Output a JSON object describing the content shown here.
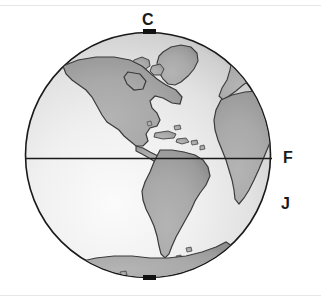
{
  "figure": {
    "name": "earth-globe-diagram"
  },
  "labels": [
    {
      "id": "c",
      "text": "C",
      "meaning": "north-pole-label"
    },
    {
      "id": "f",
      "text": "F",
      "meaning": "equator-label"
    },
    {
      "id": "j",
      "text": "J",
      "meaning": "southern-limb-label"
    }
  ],
  "markers": {
    "north_pole": "black-rectangle",
    "south_pole": "black-rectangle"
  },
  "lines": {
    "equator": "horizontal-line"
  },
  "colors": {
    "ocean_light": "#f5f5f5",
    "ocean_mid": "#e4e4e4",
    "ocean_dark": "#bdbdbd",
    "land": "#a8a8a8",
    "land_shadow": "#9a9a9a",
    "outline": "#1a1a1a",
    "marker": "#111111",
    "rule": "#e6e6e6",
    "label": "#1a1a1a",
    "background": "#ffffff"
  },
  "geometry": {
    "center_x": 148,
    "center_y": 155,
    "radius": 123,
    "equator_y": 158
  }
}
